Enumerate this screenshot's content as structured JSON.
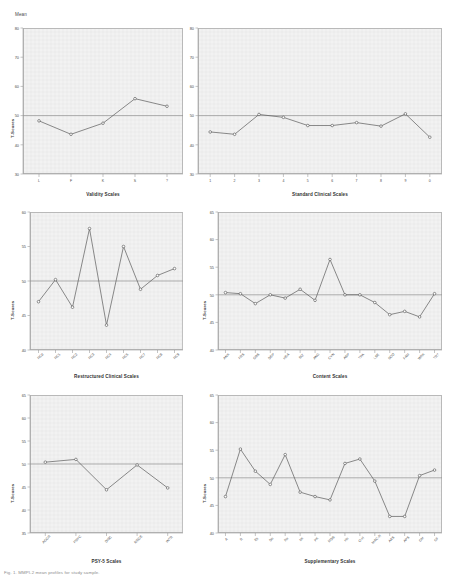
{
  "figure": {
    "mean_label": "Mean",
    "y_axis_label": "T-Scores",
    "caption": "Fig. 1. MMPI-2 mean profiles for study sample."
  },
  "chart_data": [
    {
      "id": "validity",
      "type": "line",
      "title": "Validity Scales",
      "xlabel": "Validity Scales",
      "ylabel": "T-Scores",
      "categories": [
        "L",
        "F",
        "K",
        "S",
        "?"
      ],
      "values": [
        48.2,
        43.6,
        47.4,
        55.8,
        53.2
      ],
      "ylim": [
        30,
        80
      ],
      "yticks": [
        30,
        40,
        50,
        60,
        70,
        80
      ],
      "reference_line": 50,
      "grid": true,
      "legend": "none",
      "marker": "open-circle"
    },
    {
      "id": "standard-clinical",
      "type": "line",
      "title": "Standard Clinical Scales",
      "xlabel": "Standard Clinical Scales",
      "ylabel": "T-Scores",
      "categories": [
        "1",
        "2",
        "3",
        "4",
        "5",
        "6",
        "7",
        "8",
        "9",
        "0"
      ],
      "values": [
        44.4,
        43.6,
        50.4,
        49.4,
        46.6,
        46.6,
        47.6,
        46.4,
        50.6,
        42.6
      ],
      "ylim": [
        30,
        80
      ],
      "yticks": [
        30,
        40,
        50,
        60,
        70,
        80
      ],
      "reference_line": 50,
      "grid": true,
      "legend": "none",
      "marker": "open-circle"
    },
    {
      "id": "restructured-clinical",
      "type": "line",
      "title": "Restructured Clinical Scales",
      "xlabel": "Restructured Clinical Scales",
      "ylabel": "T-Scores",
      "categories": [
        "RCd",
        "RC1",
        "RC2",
        "RC3",
        "RC4",
        "RC6",
        "RC7",
        "RC8",
        "RC9"
      ],
      "values": [
        47.0,
        50.2,
        46.2,
        57.6,
        43.6,
        55.0,
        48.8,
        50.8,
        51.8
      ],
      "ylim": [
        40,
        60
      ],
      "yticks": [
        40,
        45,
        50,
        55,
        60
      ],
      "reference_line": 50,
      "grid": true,
      "legend": "none",
      "marker": "open-circle"
    },
    {
      "id": "content",
      "type": "line",
      "title": "Content Scales",
      "xlabel": "Content Scales",
      "ylabel": "T-Scores",
      "categories": [
        "ANX",
        "FRS",
        "OBS",
        "DEP",
        "HEA",
        "BIZ",
        "ANG",
        "CYN",
        "ASP",
        "TPA",
        "LSE",
        "SOD",
        "FAM",
        "WRK",
        "TRT"
      ],
      "values": [
        50.4,
        50.2,
        48.4,
        50.0,
        49.4,
        51.0,
        49.0,
        56.4,
        50.0,
        50.0,
        48.6,
        46.4,
        47.0,
        46.0,
        50.2
      ],
      "ylim": [
        40,
        65
      ],
      "yticks": [
        40,
        45,
        50,
        55,
        60,
        65
      ],
      "reference_line": 50,
      "grid": true,
      "legend": "none",
      "marker": "open-circle"
    },
    {
      "id": "psy5",
      "type": "line",
      "title": "PSY-5 Scales",
      "xlabel": "PSY-5 Scales",
      "ylabel": "T-Scores",
      "categories": [
        "AGGR",
        "PSYC",
        "DISC",
        "NEGE",
        "INTR"
      ],
      "values": [
        50.4,
        51.0,
        44.4,
        49.8,
        44.8
      ],
      "ylim": [
        35,
        65
      ],
      "yticks": [
        35,
        40,
        45,
        50,
        55,
        60,
        65
      ],
      "reference_line": 50,
      "grid": true,
      "legend": "none",
      "marker": "open-circle"
    },
    {
      "id": "supplementary",
      "type": "line",
      "title": "Supplementary Scales",
      "xlabel": "Supplementary Scales",
      "ylabel": "T-Scores",
      "categories": [
        "A",
        "R",
        "Es",
        "Do",
        "Re",
        "Mt",
        "PK",
        "MDS",
        "Ho",
        "O-H",
        "MAC-R",
        "AAS",
        "APS",
        "GM",
        "GF"
      ],
      "values": [
        46.6,
        55.2,
        51.2,
        48.8,
        54.2,
        47.4,
        46.6,
        46.0,
        52.6,
        53.4,
        49.4,
        43.0,
        43.0,
        50.4,
        51.4
      ],
      "ylim": [
        40,
        65
      ],
      "yticks": [
        40,
        45,
        50,
        55,
        60,
        65
      ],
      "reference_line": 50,
      "grid": true,
      "legend": "none",
      "marker": "open-circle"
    }
  ]
}
